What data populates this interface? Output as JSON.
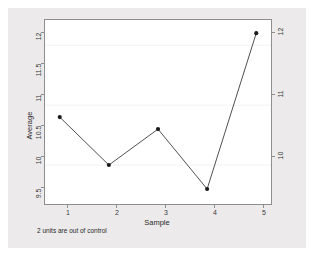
{
  "chart_data": {
    "type": "line",
    "title": "",
    "subtitle": "",
    "xlabel": "Sample",
    "ylabel": "Average",
    "x": [
      1,
      2,
      3,
      4,
      5
    ],
    "categories": [
      "1",
      "2",
      "3",
      "4",
      "5"
    ],
    "values": [
      10.8,
      10.0,
      10.6,
      9.6,
      12.2
    ],
    "series": [
      {
        "name": "Average",
        "values": [
          10.8,
          10.0,
          10.6,
          9.6,
          12.2
        ]
      }
    ],
    "xlim": [
      0.7,
      5.3
    ],
    "ylim": [
      9.35,
      12.42
    ],
    "x_tick_labels": [
      "1",
      "2",
      "3",
      "4",
      "5"
    ],
    "x_tick_values": [
      1,
      2,
      3,
      4,
      5
    ],
    "y_tick_labels_left": [
      "9.5",
      "10",
      "10.5",
      "11",
      "11.5",
      "12"
    ],
    "y_tick_values_left": [
      9.5,
      10,
      10.5,
      11,
      11.5,
      12
    ],
    "y_tick_labels_right": [
      "10",
      "11",
      "12"
    ],
    "y_tick_values_right": [
      10,
      11,
      12
    ],
    "gridlines": [
      10,
      11,
      12
    ],
    "grid": true,
    "legend": "none",
    "annotations": [
      "2 units are out of control"
    ],
    "marker": "filled-circle",
    "line_color": "#3a3a3a",
    "marker_color": "#1a1a1a",
    "grid_color": "#f2f2f2",
    "panel_background": "#ffffff",
    "figure_background": "#eceaea"
  },
  "figure": {
    "footnote": "2 units are out of control",
    "y_axis_title": "Average",
    "x_axis_title": "Sample"
  }
}
